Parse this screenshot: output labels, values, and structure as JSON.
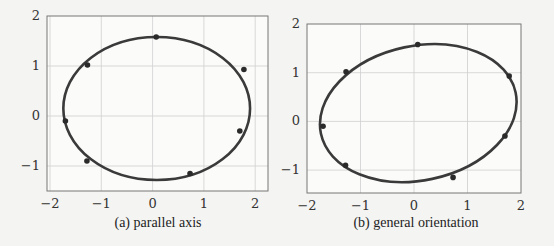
{
  "chart_data": [
    {
      "type": "scatter",
      "title": "",
      "caption": "(a) parallel axis",
      "xlabel": "",
      "ylabel": "",
      "xlim": [
        -2.05,
        2.3
      ],
      "ylim": [
        -1.5,
        2
      ],
      "xticks": [
        "−2",
        "−1",
        "0",
        "1",
        "2"
      ],
      "yticks": [
        "2",
        "1",
        "0",
        "−1"
      ],
      "grid": true,
      "points": [
        {
          "x": 0.07,
          "y": 1.58
        },
        {
          "x": -1.27,
          "y": 1.02
        },
        {
          "x": 1.78,
          "y": 0.93
        },
        {
          "x": -1.7,
          "y": -0.1
        },
        {
          "x": 1.7,
          "y": -0.3
        },
        {
          "x": -1.28,
          "y": -0.9
        },
        {
          "x": 0.73,
          "y": -1.15
        }
      ],
      "fit_ellipse": {
        "cx": 0.08,
        "cy": 0.15,
        "rx": 1.82,
        "ry": 1.43,
        "angle_deg": 0
      }
    },
    {
      "type": "scatter",
      "title": "",
      "caption": "(b) general orientation",
      "xlabel": "",
      "ylabel": "",
      "xlim": [
        -2,
        2
      ],
      "ylim": [
        -1.5,
        2
      ],
      "xticks": [
        "−2",
        "−1",
        "0",
        "1",
        "2"
      ],
      "yticks": [
        "2",
        "1",
        "0",
        "−1"
      ],
      "grid": true,
      "points": [
        {
          "x": 0.07,
          "y": 1.58
        },
        {
          "x": -1.27,
          "y": 1.02
        },
        {
          "x": 1.78,
          "y": 0.93
        },
        {
          "x": -1.7,
          "y": -0.1
        },
        {
          "x": 1.7,
          "y": -0.3
        },
        {
          "x": -1.28,
          "y": -0.9
        },
        {
          "x": 0.73,
          "y": -1.15
        }
      ],
      "fit_ellipse": {
        "cx": 0.08,
        "cy": 0.17,
        "rx": 1.86,
        "ry": 1.38,
        "angle_deg": 12
      }
    }
  ],
  "captions": {
    "a": "(a) parallel axis",
    "b": "(b) general orientation"
  }
}
